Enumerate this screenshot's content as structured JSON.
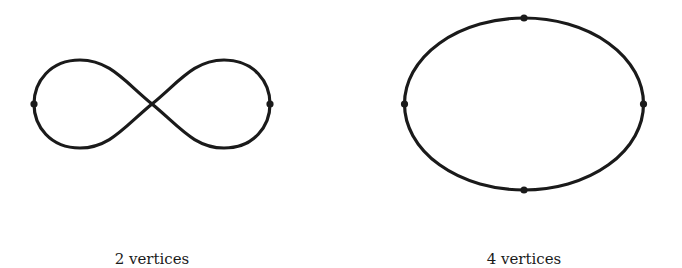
{
  "figures": [
    {
      "shape": "figure-eight",
      "caption": "2 vertices",
      "vertex_count": 2
    },
    {
      "shape": "ellipse",
      "caption": "4 vertices",
      "vertex_count": 4
    }
  ],
  "colors": {
    "stroke": "#1a1a1a",
    "background": "#ffffff"
  }
}
